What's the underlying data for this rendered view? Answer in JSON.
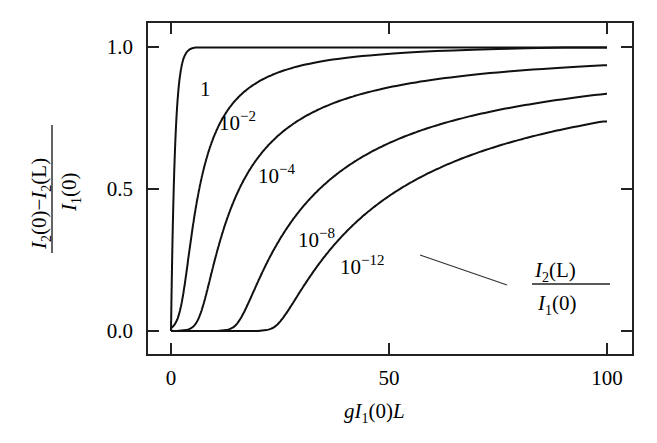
{
  "chart_data": {
    "type": "line",
    "title": "",
    "xlabel": "gI1(0)L",
    "ylabel": "(I2(0) - I2(L)) / I1(0)",
    "xlim": [
      -5,
      105
    ],
    "ylim": [
      -0.06,
      1.11
    ],
    "grid": false,
    "x_ticks": [
      0,
      50,
      100
    ],
    "x_tick_labels": [
      "0",
      "50",
      "100"
    ],
    "y_ticks": [
      0.0,
      0.5,
      1.0
    ],
    "y_tick_labels": [
      "0.0",
      "0.5",
      "1.0"
    ],
    "annotation": {
      "text": "I2(L) / I1(0)",
      "description": "Curves labeled by seed ratio I2(L)/I1(0)"
    },
    "series": [
      {
        "name": "1",
        "label": "1",
        "epsilon": 1,
        "points": [
          [
            0,
            0
          ],
          [
            0.3,
            0.3
          ],
          [
            0.6,
            0.55
          ],
          [
            1,
            0.75
          ],
          [
            1.5,
            0.88
          ],
          [
            2,
            0.95
          ],
          [
            3,
            0.99
          ],
          [
            5,
            1.0
          ],
          [
            100,
            1.0
          ]
        ]
      },
      {
        "name": "10^-2",
        "label": "10",
        "exp": "−2",
        "epsilon": 0.01,
        "points": [
          [
            0,
            0
          ],
          [
            1,
            0.02
          ],
          [
            2,
            0.1
          ],
          [
            4,
            0.3
          ],
          [
            6,
            0.5
          ],
          [
            8,
            0.6
          ],
          [
            12,
            0.74
          ],
          [
            20,
            0.85
          ],
          [
            30,
            0.9
          ],
          [
            50,
            0.95
          ],
          [
            100,
            0.985
          ]
        ]
      },
      {
        "name": "10^-4",
        "label": "10",
        "exp": "−4",
        "epsilon": 0.0001,
        "points": [
          [
            0,
            0
          ],
          [
            4,
            0.02
          ],
          [
            7,
            0.1
          ],
          [
            10,
            0.3
          ],
          [
            14,
            0.5
          ],
          [
            19.5,
            0.6
          ],
          [
            30,
            0.74
          ],
          [
            50,
            0.84
          ],
          [
            75,
            0.9
          ],
          [
            100,
            0.935
          ]
        ]
      },
      {
        "name": "10^-8",
        "label": "10",
        "exp": "−8",
        "epsilon": 1e-08,
        "points": [
          [
            0,
            0
          ],
          [
            10,
            0.0
          ],
          [
            13,
            0.02
          ],
          [
            18,
            0.1
          ],
          [
            24,
            0.3
          ],
          [
            30,
            0.45
          ],
          [
            42.5,
            0.6
          ],
          [
            60,
            0.7
          ],
          [
            80,
            0.78
          ],
          [
            100,
            0.84
          ]
        ]
      },
      {
        "name": "10^-12",
        "label": "10",
        "exp": "−12",
        "epsilon": 1e-12,
        "points": [
          [
            0,
            0
          ],
          [
            20,
            0.0
          ],
          [
            23,
            0.02
          ],
          [
            28,
            0.1
          ],
          [
            35,
            0.3
          ],
          [
            44,
            0.45
          ],
          [
            55,
            0.53
          ],
          [
            70,
            0.62
          ],
          [
            85,
            0.69
          ],
          [
            100,
            0.74
          ]
        ]
      }
    ]
  },
  "labels": {
    "y_axis": {
      "num_a": "I",
      "sub_a": "2",
      "paren_a": "(0)",
      "minus": "−",
      "num_b": "I",
      "sub_b": "2",
      "paren_b": "(L)",
      "den": "I",
      "den_sub": "1",
      "den_paren": "(0)"
    },
    "x_axis": {
      "g": "g",
      "I": "I",
      "sub": "1",
      "paren": "(0)",
      "L": "L"
    },
    "annotation": {
      "num": "I",
      "num_sub": "2",
      "num_paren": "(L)",
      "den": "I",
      "den_sub": "1",
      "den_paren": "(0)"
    }
  }
}
